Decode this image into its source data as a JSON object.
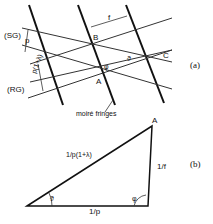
{
  "figure": {
    "panel_a": {
      "id_label": "(a)",
      "grating_labels": {
        "sg": "(SG)",
        "rg": "(RG)"
      },
      "pitch_labels": {
        "sg_pitch": "p",
        "rg_pitch": "p(1+λ)",
        "fringe_spacing": "f"
      },
      "points": {
        "a": "A",
        "b": "B",
        "c": "C"
      },
      "angles": {
        "phi": "φ",
        "theta": "ϑ"
      },
      "caption": "moiré fringes"
    },
    "panel_b": {
      "id_label": "(b)",
      "vertex": "A",
      "sides": {
        "hypotenuse": "1/p(1+λ)",
        "right": "1/f",
        "base": "1/p"
      },
      "angles": {
        "left": "ϑ",
        "right": "φ"
      }
    },
    "colors": {
      "ink": "#111111",
      "thin_line": "#333333",
      "background": "#ffffff"
    }
  }
}
